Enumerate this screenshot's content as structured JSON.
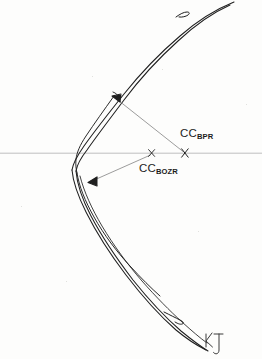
{
  "figure": {
    "background_color": "#fdfdfc",
    "ink_color": "#1c1c1c",
    "axis_color": "#b9b9b9",
    "leader_color": "#8a8a8a",
    "labels": [
      {
        "id": "cc-bpr",
        "base": "CC",
        "subscript": "BPR",
        "x": 180,
        "y": 128
      },
      {
        "id": "cc-bozr",
        "base": "CC",
        "subscript": "BOZR",
        "x": 139,
        "y": 163
      }
    ],
    "axis": {
      "name": "optical-axis",
      "y": 153,
      "x_start": 0,
      "x_end": 262
    },
    "centre_markers": [
      {
        "id": "marker-bozr",
        "x": 152,
        "y": 153,
        "glyph": "x"
      },
      {
        "id": "marker-bpr",
        "x": 185,
        "y": 153,
        "glyph": "x"
      }
    ],
    "radius_arrows": [
      {
        "id": "arrow-bpr",
        "from_x": 183,
        "from_y": 151,
        "to_x": 113,
        "to_y": 96
      },
      {
        "id": "arrow-bozr",
        "from_x": 150,
        "from_y": 155,
        "to_x": 89,
        "to_y": 183
      }
    ],
    "signature": {
      "id": "artist-signature",
      "text": "KJ",
      "x": 203,
      "y": 330
    }
  }
}
